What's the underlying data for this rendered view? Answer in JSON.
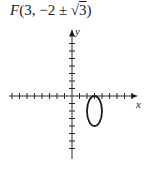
{
  "title": {
    "func": "F",
    "open": "(",
    "x": "3",
    "sep": ", ",
    "y_prefix": "−2 ± √",
    "radicand": "3",
    "close": ")"
  },
  "axes": {
    "x_label": "x",
    "y_label": "y"
  },
  "chart_data": {
    "type": "diagram",
    "title": "F(3, −2 ± √3)",
    "xlabel": "x",
    "ylabel": "y",
    "origin_px": [
      72,
      96
    ],
    "unit_px": 7.5,
    "x_ticks_left": 8,
    "x_ticks_right": 8,
    "y_ticks_up": 8,
    "y_ticks_down": 7,
    "ellipse": {
      "center": [
        3,
        -2
      ],
      "semi_axis_x": 1,
      "semi_axis_y": 2,
      "foci": [
        [
          3,
          -0.268
        ],
        [
          3,
          -3.732
        ]
      ]
    },
    "grid": false
  }
}
